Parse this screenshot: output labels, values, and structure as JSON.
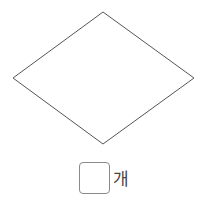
{
  "figure": {
    "shape": "rhombus",
    "vertices": {
      "top": [
        103,
        12
      ],
      "right": [
        194,
        78
      ],
      "bottom": [
        103,
        144
      ],
      "left": [
        13,
        78
      ]
    },
    "stroke_color": "#555555"
  },
  "answer": {
    "value": "",
    "unit": "개"
  }
}
